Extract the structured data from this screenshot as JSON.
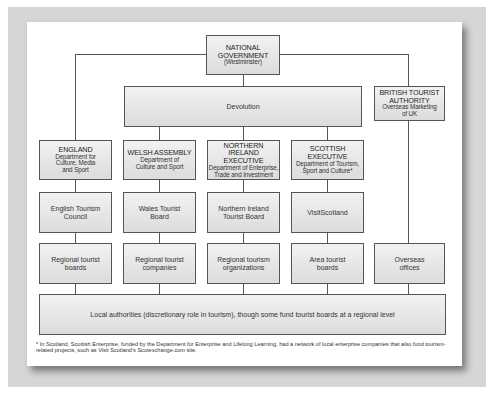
{
  "diagram": {
    "top": {
      "national_government": {
        "title": "NATIONAL",
        "title2": "GOVERNMENT",
        "sub": "(Westminster)"
      }
    },
    "devolution": {
      "label": "Devolution"
    },
    "british_tourist_authority": {
      "title": "BRITISH TOURIST",
      "title2": "AUTHORITY",
      "sub": "Overseas Marketing",
      "sub2": "of UK"
    },
    "columns": [
      {
        "name": "england",
        "head_title": "ENGLAND",
        "head_sub": [
          "Department for",
          "Culture, Media",
          "and Sport"
        ],
        "board": [
          "English Tourism",
          "Council"
        ],
        "regional": [
          "Regional tourist",
          "boards"
        ]
      },
      {
        "name": "wales",
        "head_title": "WELSH ASSEMBLY",
        "head_sub": [
          "Department of",
          "Culture and Sport"
        ],
        "board": [
          "Wales Tourist",
          "Board"
        ],
        "regional": [
          "Regional tourist",
          "companies"
        ]
      },
      {
        "name": "northern-ireland",
        "head_title": "NORTHERN IRELAND",
        "head_title2": "EXECUTIVE",
        "head_sub": [
          "Department of Enterprise,",
          "Trade and Investment"
        ],
        "board": [
          "Northern Ireland",
          "Tourist Board"
        ],
        "regional": [
          "Regional tourism",
          "organizations"
        ]
      },
      {
        "name": "scotland",
        "head_title": "SCOTTISH EXECUTIVE",
        "head_sub": [
          "Department of Tourism,",
          "Sport and Culture*"
        ],
        "board": [
          "VisitScotland"
        ],
        "regional": [
          "Area tourist",
          "boards"
        ]
      }
    ],
    "overseas": [
      "Overseas",
      "offices"
    ],
    "local_authorities": {
      "label": "Local authorities (discretionary role in tourism), though some fund tourist boards at a regional level"
    },
    "footnote": "* In Scotland, Scottish Enterprise, funded by the Department for Enterprise and Lifelong Learning, had a network of local enterprise companies that also fund tourism-related projects, such as Visit Scotland's Scotexchange.com site."
  },
  "colors": {
    "frame": "#d6d6d6",
    "box_fill": "#e6e6e6",
    "box_border": "#555555",
    "connector": "#555555"
  }
}
